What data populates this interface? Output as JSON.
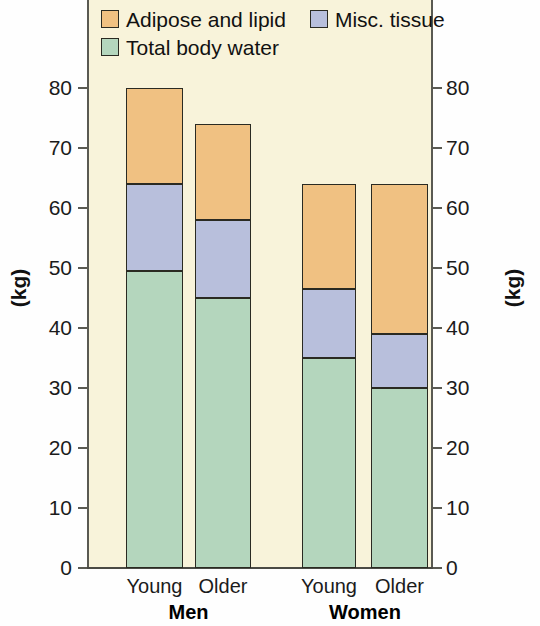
{
  "chart_data": {
    "type": "bar",
    "subtype": "stacked",
    "title": "",
    "xlabel": "",
    "ylabel": "(kg)",
    "ylabel_right": "(kg)",
    "ylim": [
      0,
      80
    ],
    "ytick_step": 10,
    "yticks": [
      0,
      10,
      20,
      30,
      40,
      50,
      60,
      70,
      80
    ],
    "ytick_labels": [
      "0",
      "10",
      "20",
      "30",
      "40",
      "50",
      "60",
      "70",
      "80"
    ],
    "grid": false,
    "legend_position": "top-left",
    "categories": [
      "Young",
      "Older",
      "Young",
      "Older"
    ],
    "groups": [
      {
        "label": "Men",
        "categories": [
          "Young",
          "Older"
        ]
      },
      {
        "label": "Women",
        "categories": [
          "Young",
          "Older"
        ]
      }
    ],
    "series": [
      {
        "name": "Total body water",
        "color": "#b4d6bd",
        "values": [
          49.5,
          45.0,
          35.0,
          30.0
        ]
      },
      {
        "name": "Misc. tissue",
        "color": "#b8bfdc",
        "values": [
          14.5,
          13.0,
          11.5,
          9.0
        ]
      },
      {
        "name": "Adipose and lipid",
        "color": "#f0c182",
        "values": [
          16.0,
          16.0,
          17.5,
          25.0
        ]
      }
    ],
    "totals": [
      80.0,
      74.0,
      64.0,
      64.0
    ],
    "bars": [
      {
        "group": "Men",
        "category": "Young",
        "total": 80,
        "segments": [
          {
            "series": "Total body water",
            "from": 0,
            "to": 49.5
          },
          {
            "series": "Misc. tissue",
            "from": 49.5,
            "to": 64
          },
          {
            "series": "Adipose and lipid",
            "from": 64,
            "to": 80
          }
        ]
      },
      {
        "group": "Men",
        "category": "Older",
        "total": 74,
        "segments": [
          {
            "series": "Total body water",
            "from": 0,
            "to": 45
          },
          {
            "series": "Misc. tissue",
            "from": 45,
            "to": 58
          },
          {
            "series": "Adipose and lipid",
            "from": 58,
            "to": 74
          }
        ]
      },
      {
        "group": "Women",
        "category": "Young",
        "total": 64,
        "segments": [
          {
            "series": "Total body water",
            "from": 0,
            "to": 35
          },
          {
            "series": "Misc. tissue",
            "from": 35,
            "to": 46.5
          },
          {
            "series": "Adipose and lipid",
            "from": 46.5,
            "to": 64
          }
        ]
      },
      {
        "group": "Women",
        "category": "Older",
        "total": 64,
        "segments": [
          {
            "series": "Total body water",
            "from": 0,
            "to": 30
          },
          {
            "series": "Misc. tissue",
            "from": 30,
            "to": 39
          },
          {
            "series": "Adipose and lipid",
            "from": 39,
            "to": 64
          }
        ]
      }
    ],
    "legend": [
      {
        "label": "Adipose and lipid",
        "color": "#f0c182"
      },
      {
        "label": "Misc. tissue",
        "color": "#b8bfdc"
      },
      {
        "label": "Total body water",
        "color": "#b4d6bd"
      }
    ],
    "colors": {
      "adipose": "#f0c182",
      "misc": "#b8bfdc",
      "water": "#b4d6bd",
      "plot_background": "#f8f3da",
      "figure_background": "#fefefe",
      "axis": "#5a5a52",
      "outline": "#2a2a22",
      "text": "#1b1b1b"
    }
  }
}
